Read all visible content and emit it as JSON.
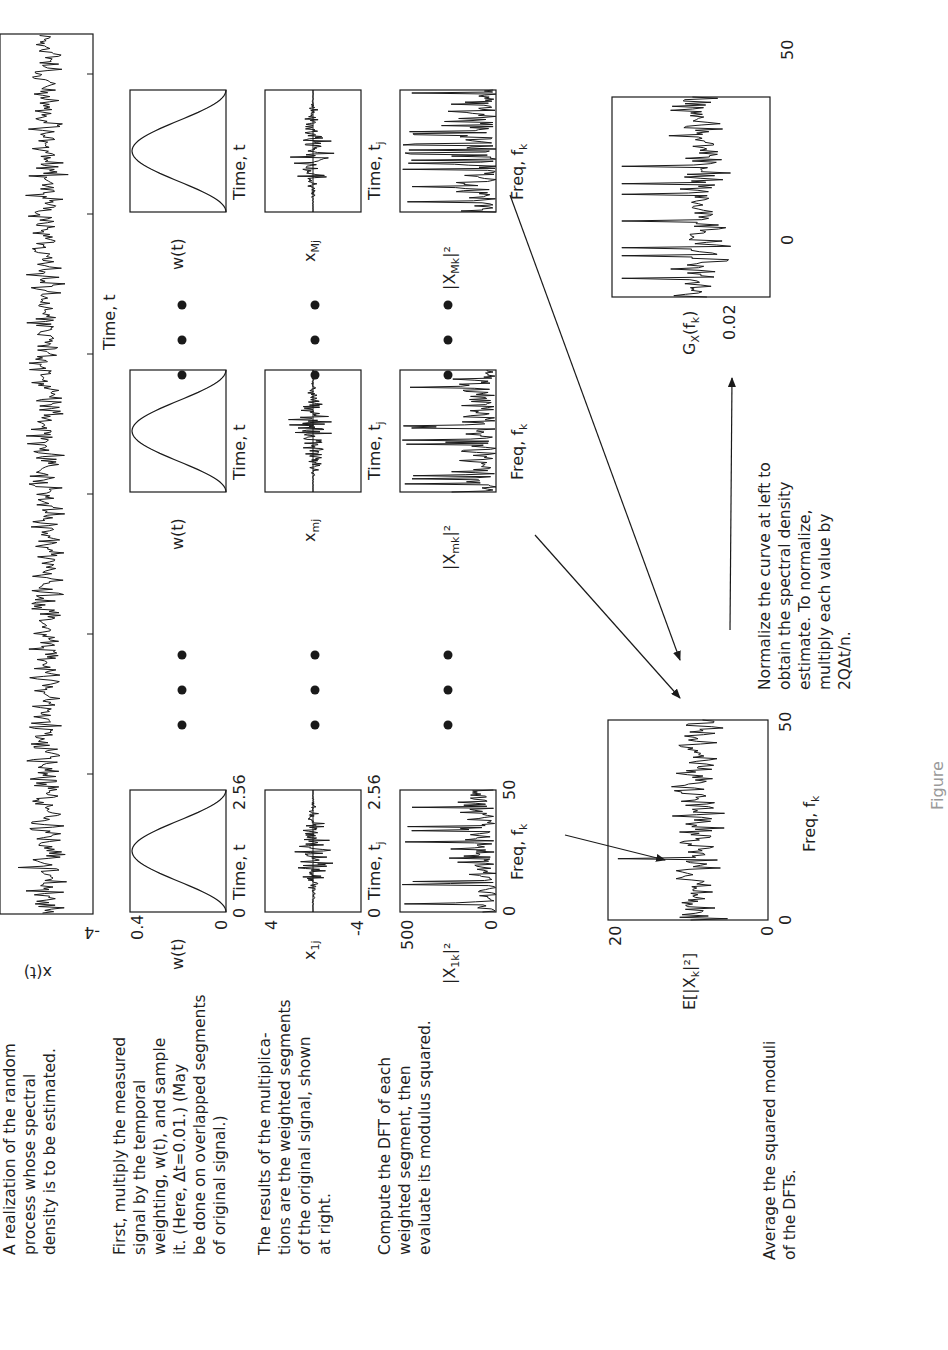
{
  "figure": {
    "orientation": "rotated 90 degrees counter-clockwise",
    "steps": [
      {
        "id": "realization",
        "text": "A realization of the random\nprocess whose spectral\ndensity is to be estimated."
      },
      {
        "id": "weighting",
        "text": "First, multiply the measured\nsignal by the temporal\nweighting, w(t), and sample\nit. (Here, Δt=0.01.) (May\nbe done on overlapped segments\nof original signal.)"
      },
      {
        "id": "segments",
        "text": "The results of the multiplica-\ntions are the weighted segments\nof the original signal, shown\nat right."
      },
      {
        "id": "dft",
        "text": "Compute the DFT of each\nweighted segment, then\nevaluate its modulus squared."
      },
      {
        "id": "average",
        "text": "Average the squared moduli\nof the DFTs."
      },
      {
        "id": "normalize",
        "text": "Normalize the curve at left to\nobtain the spectral density\nestimate. To normalize,\nmultiply each value by\n2QΔt/n."
      }
    ],
    "signal_plot": {
      "ylabel": "x(t)",
      "ytick_top": "4",
      "ytick_bottom": "-4",
      "xlabel": "Time, t"
    },
    "segment_first": {
      "weight": {
        "ylabel": "w(t)",
        "ytick_top": "0.4",
        "ytick_bottom": "0",
        "xtick_left": "0",
        "xtick_right": "2.56",
        "xlabel": "Time, t"
      },
      "segment": {
        "ylabel": "x",
        "ylabel_sub": "1j",
        "ytick_top": "4",
        "ytick_bottom": "-4",
        "xtick_left": "0",
        "xtick_right": "2.56",
        "xlabel": "Time, t",
        "xlabel_sub": "j"
      },
      "spectrum": {
        "ylabel": "|X",
        "ylabel_sub": "1k",
        "ylabel_tail": "|²",
        "ytick_top": "500",
        "ytick_bottom": "0",
        "xtick_left": "0",
        "xtick_right": "50",
        "xlabel": "Freq, f",
        "xlabel_sub": "k"
      }
    },
    "segment_middle": {
      "weight": {
        "ylabel": "w(t)",
        "xlabel": "Time, t"
      },
      "segment": {
        "ylabel": "x",
        "ylabel_sub": "mj",
        "xlabel": "Time, t",
        "xlabel_sub": "j"
      },
      "spectrum": {
        "ylabel": "|X",
        "ylabel_sub": "mk",
        "ylabel_tail": "|²",
        "xlabel": "Freq, f",
        "xlabel_sub": "k"
      }
    },
    "segment_last": {
      "weight": {
        "ylabel": "w(t)",
        "xlabel": "Time, t"
      },
      "segment": {
        "ylabel": "x",
        "ylabel_sub": "Mj",
        "xlabel": "Time, t",
        "xlabel_sub": "j"
      },
      "spectrum": {
        "ylabel": "|X",
        "ylabel_sub": "Mk",
        "ylabel_tail": "|²",
        "xlabel": "Freq, f",
        "xlabel_sub": "k"
      }
    },
    "average_plot": {
      "ylabel": "E[|X",
      "ylabel_sub": "k",
      "ylabel_tail": "|²]",
      "ytick_top": "20",
      "ytick_bottom": "0",
      "xtick_left": "0",
      "xtick_right": "50",
      "xlabel": "Freq, f",
      "xlabel_sub": "k"
    },
    "estimate_plot": {
      "ylabel": "G",
      "ylabel_sub": "X",
      "ylabel_tail": "(f",
      "ylabel_tail_sub": "k",
      "ylabel_end": ")",
      "ytick_top": "0.02",
      "ytick_bottom": "0",
      "xtick_left": "0",
      "xtick_right": "50"
    },
    "ellipsis": "• • •",
    "caption_partial": "Figure"
  },
  "colors": {
    "ink": "#1a1a1a",
    "paper": "#ffffff",
    "faint": "#9a9a9a"
  }
}
